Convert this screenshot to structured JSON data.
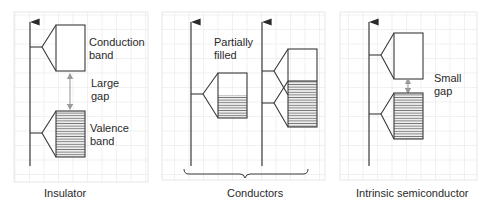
{
  "diagram": {
    "type": "energy-band-diagram",
    "panels": [
      {
        "id": "insulator",
        "caption": "Insulator",
        "labels": {
          "conduction_line1": "Conduction",
          "conduction_line2": "band",
          "gap_line1": "Large",
          "gap_line2": "gap",
          "valence_line1": "Valence",
          "valence_line2": "band"
        }
      },
      {
        "id": "conductors",
        "caption": "Conductors",
        "labels": {
          "partial_line1": "Partially",
          "partial_line2": "filled"
        }
      },
      {
        "id": "intrinsic-semiconductor",
        "caption": "Intrinsic semiconductor",
        "labels": {
          "gap_line1": "Small",
          "gap_line2": "gap"
        }
      }
    ],
    "colors": {
      "grid": "#dcdcdc",
      "line": "#3a3a3a",
      "fill_hatch": "#8a8a8a",
      "gap_arrow": "#9a9a9a",
      "text": "#2a2a2a"
    }
  }
}
